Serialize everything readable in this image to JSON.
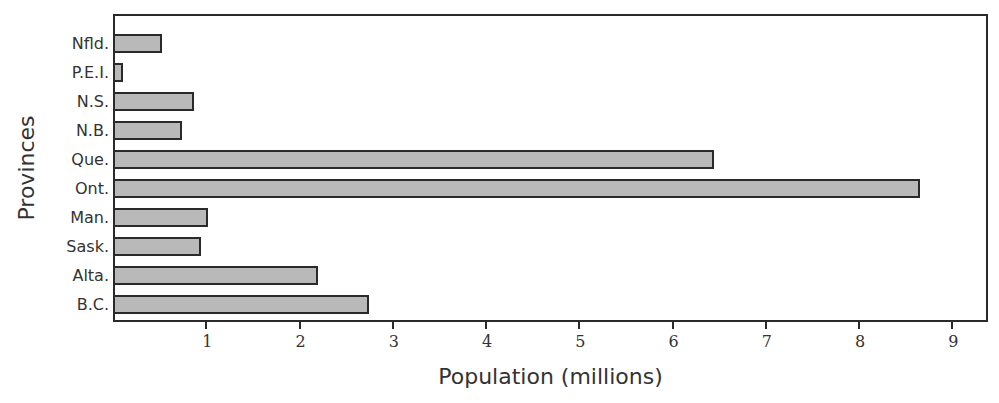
{
  "chart_data": {
    "type": "bar",
    "orientation": "horizontal",
    "title": "",
    "xlabel": "Population (millions)",
    "ylabel": "Provinces",
    "categories": [
      "Nfld.",
      "P.E.I.",
      "N.S.",
      "N.B.",
      "Que.",
      "Ont.",
      "Man.",
      "Sask.",
      "Alta.",
      "B.C."
    ],
    "values": [
      0.53,
      0.11,
      0.87,
      0.74,
      6.45,
      8.65,
      1.02,
      0.94,
      2.2,
      2.74
    ],
    "xlim": [
      0,
      9.4
    ],
    "xticks": [
      1,
      2,
      3,
      4,
      5,
      6,
      7,
      8,
      9
    ],
    "grid": false,
    "legend": null,
    "colors": {
      "bar_fill": "#b9b9b9",
      "bar_border": "#2a2a2a"
    }
  }
}
